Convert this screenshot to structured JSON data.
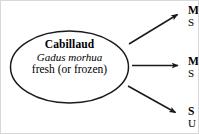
{
  "diagram": {
    "type": "flow-diagram",
    "background_color": "#ffffff",
    "line_color": "#1a1a1a",
    "text_color": "#000000",
    "node": {
      "shape": "ellipse",
      "name": "Cabillaud",
      "scientific_name": "Gadus morhua",
      "state": "fresh (or frozen)"
    },
    "branches": [
      {
        "arrow": "up-right",
        "head": "M",
        "sub": "S"
      },
      {
        "arrow": "right",
        "head": "M",
        "sub": "S"
      },
      {
        "arrow": "down-right",
        "head": "S",
        "sub": "U"
      }
    ]
  }
}
